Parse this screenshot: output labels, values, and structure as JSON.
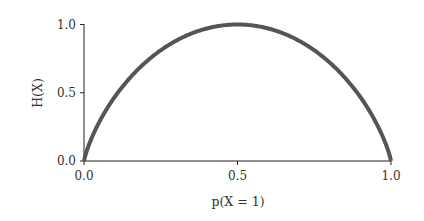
{
  "chart_data": {
    "type": "line",
    "title": "",
    "xlabel": "p(X = 1)",
    "ylabel": "H(X)",
    "xlim": [
      0.0,
      1.0
    ],
    "ylim": [
      0.0,
      1.0
    ],
    "xticks": [
      0.0,
      0.5,
      1.0
    ],
    "xtick_labels": [
      "0.0",
      "0.5",
      "1.0"
    ],
    "yticks": [
      0.0,
      0.5,
      1.0
    ],
    "ytick_labels": [
      "0.0",
      "0.5",
      "1.0"
    ],
    "grid": false,
    "legend": null,
    "series": [
      {
        "name": "Binary entropy H(X)",
        "color": "#555555",
        "x": [
          0.0,
          0.05,
          0.1,
          0.15,
          0.2,
          0.25,
          0.3,
          0.35,
          0.4,
          0.45,
          0.5,
          0.55,
          0.6,
          0.65,
          0.7,
          0.75,
          0.8,
          0.85,
          0.9,
          0.95,
          1.0
        ],
        "y": [
          0.0,
          0.286,
          0.469,
          0.61,
          0.722,
          0.811,
          0.881,
          0.934,
          0.971,
          0.993,
          1.0,
          0.993,
          0.971,
          0.934,
          0.881,
          0.811,
          0.722,
          0.61,
          0.469,
          0.286,
          0.0
        ]
      }
    ]
  }
}
